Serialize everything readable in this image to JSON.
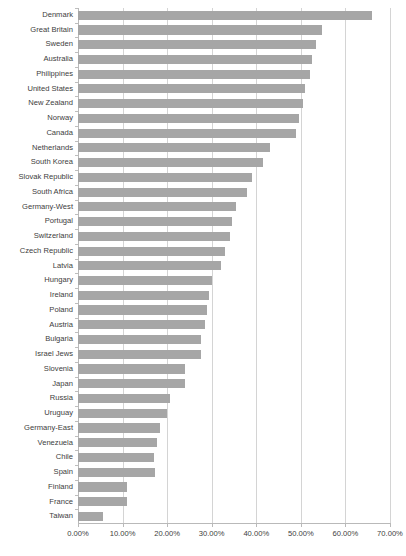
{
  "chart_data": {
    "type": "bar",
    "orientation": "horizontal",
    "title": "",
    "subtitle": "",
    "xlabel": "",
    "ylabel": "",
    "xlim": [
      0,
      70
    ],
    "ylim": null,
    "grid": true,
    "legend": null,
    "legend_position": "none",
    "value_format": "percent",
    "bar_color": "#a6a6a6",
    "gridline_color": "#d4d4d4",
    "axis_color": "#b9b9b9",
    "text_color": "#3d3d3d",
    "xticks": [
      "0.00%",
      "10.00%",
      "20.00%",
      "30.00%",
      "40.00%",
      "50.00%",
      "60.00%",
      "70.00%"
    ],
    "xtick_values": [
      0,
      10,
      20,
      30,
      40,
      50,
      60,
      70
    ],
    "categories": [
      "Denmark",
      "Great Britain",
      "Sweden",
      "Australia",
      "Philippines",
      "United States",
      "New Zealand",
      "Norway",
      "Canada",
      "Netherlands",
      "South Korea",
      "Slovak Republic",
      "South Africa",
      "Germany-West",
      "Portugal",
      "Switzerland",
      "Czech Republic",
      "Latvia",
      "Hungary",
      "Ireland",
      "Poland",
      "Austria",
      "Bulgaria",
      "Israel Jews",
      "Slovenia",
      "Japan",
      "Russia",
      "Uruguay",
      "Germany-East",
      "Venezuela",
      "Chile",
      "Spain",
      "Finland",
      "France",
      "Taiwan"
    ],
    "values": [
      65.9,
      54.7,
      53.4,
      52.5,
      52.0,
      51.0,
      50.5,
      49.5,
      49.0,
      43.0,
      41.5,
      39.0,
      38.0,
      35.5,
      34.5,
      34.0,
      33.0,
      32.0,
      30.0,
      29.5,
      29.0,
      28.5,
      27.5,
      27.5,
      24.0,
      24.0,
      20.6,
      20.0,
      18.5,
      17.8,
      17.0,
      17.3,
      11.0,
      11.0,
      5.6
    ]
  }
}
